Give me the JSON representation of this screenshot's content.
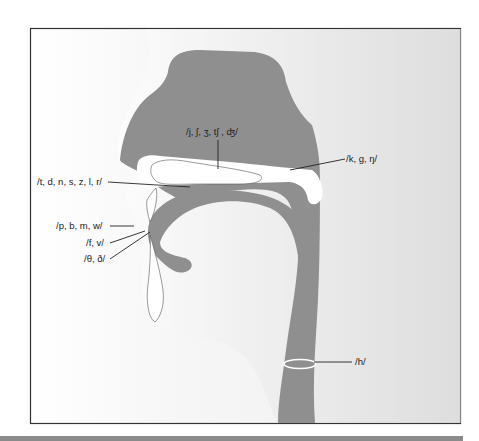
{
  "diagram": {
    "type": "sagittal-section-vocal-tract",
    "colors": {
      "frame": "#333333",
      "tissue": "#8f8f8f",
      "face_shadow": "#c8c8c8",
      "highlight": "#ffffff",
      "background": "#f4f4f4",
      "bottom_bar": "#8a8a8a"
    },
    "labels": [
      {
        "id": "palatal",
        "text": "/j, ʃ, ʒ, tʃ , ʤ/"
      },
      {
        "id": "velar",
        "text": "/k, g, ŋ/"
      },
      {
        "id": "alveolar",
        "text": "/t, d, n, s, z, l, r/"
      },
      {
        "id": "bilabial",
        "text": "/p, b, m, w/"
      },
      {
        "id": "labiodental",
        "text": "/f, v/"
      },
      {
        "id": "dental",
        "text": "/θ, ð/"
      },
      {
        "id": "glottal",
        "text": "/h/"
      }
    ]
  }
}
